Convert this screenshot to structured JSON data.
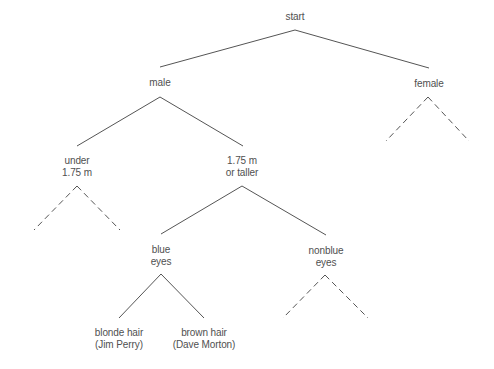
{
  "diagram": {
    "type": "decision-tree",
    "nodes": [
      {
        "id": "start",
        "lines": [
          "start"
        ],
        "x": 295,
        "y": 11
      },
      {
        "id": "male",
        "lines": [
          "male"
        ],
        "x": 160,
        "y": 77
      },
      {
        "id": "female",
        "lines": [
          "female"
        ],
        "x": 429,
        "y": 78
      },
      {
        "id": "under",
        "lines": [
          "under",
          "1.75 m"
        ],
        "x": 77,
        "y": 155
      },
      {
        "id": "taller",
        "lines": [
          "1.75 m",
          "or taller"
        ],
        "x": 242,
        "y": 155
      },
      {
        "id": "blue",
        "lines": [
          "blue",
          "eyes"
        ],
        "x": 161,
        "y": 244
      },
      {
        "id": "nonblue",
        "lines": [
          "nonblue",
          "eyes"
        ],
        "x": 326,
        "y": 245
      },
      {
        "id": "blonde",
        "lines": [
          "blonde hair",
          "(Jim Perry)"
        ],
        "x": 119,
        "y": 327
      },
      {
        "id": "brown",
        "lines": [
          "brown hair",
          "(Dave Morton)"
        ],
        "x": 204,
        "y": 327
      }
    ],
    "edges": [
      {
        "from": "start",
        "to": "male",
        "style": "solid",
        "x1": 295,
        "y1": 30,
        "x2": 160,
        "y2": 67
      },
      {
        "from": "start",
        "to": "female",
        "style": "solid",
        "x1": 295,
        "y1": 30,
        "x2": 429,
        "y2": 68
      },
      {
        "from": "male",
        "to": "under",
        "style": "solid",
        "x1": 160,
        "y1": 97,
        "x2": 77,
        "y2": 146
      },
      {
        "from": "male",
        "to": "taller",
        "style": "solid",
        "x1": 160,
        "y1": 97,
        "x2": 243,
        "y2": 146
      },
      {
        "from": "female",
        "to": "unexpanded-left",
        "style": "dashed",
        "x1": 428,
        "y1": 97,
        "x2": 386,
        "y2": 141
      },
      {
        "from": "female",
        "to": "unexpanded-right",
        "style": "dashed",
        "x1": 428,
        "y1": 97,
        "x2": 469,
        "y2": 141
      },
      {
        "from": "under",
        "to": "unexpanded-left",
        "style": "dashed",
        "x1": 77,
        "y1": 186,
        "x2": 34,
        "y2": 230
      },
      {
        "from": "under",
        "to": "unexpanded-right",
        "style": "dashed",
        "x1": 77,
        "y1": 186,
        "x2": 120,
        "y2": 230
      },
      {
        "from": "taller",
        "to": "blue",
        "style": "solid",
        "x1": 242,
        "y1": 186,
        "x2": 161,
        "y2": 234
      },
      {
        "from": "taller",
        "to": "nonblue",
        "style": "solid",
        "x1": 242,
        "y1": 186,
        "x2": 326,
        "y2": 235
      },
      {
        "from": "blue",
        "to": "blonde",
        "style": "solid",
        "x1": 161,
        "y1": 274,
        "x2": 119,
        "y2": 318
      },
      {
        "from": "blue",
        "to": "brown",
        "style": "solid",
        "x1": 161,
        "y1": 274,
        "x2": 204,
        "y2": 318
      },
      {
        "from": "nonblue",
        "to": "unexpanded-left",
        "style": "dashed",
        "x1": 325,
        "y1": 275,
        "x2": 283,
        "y2": 318
      },
      {
        "from": "nonblue",
        "to": "unexpanded-right",
        "style": "dashed",
        "x1": 325,
        "y1": 275,
        "x2": 368,
        "y2": 318
      }
    ],
    "colors": {
      "line": "#555555",
      "text": "#505050",
      "background": "#ffffff"
    }
  }
}
